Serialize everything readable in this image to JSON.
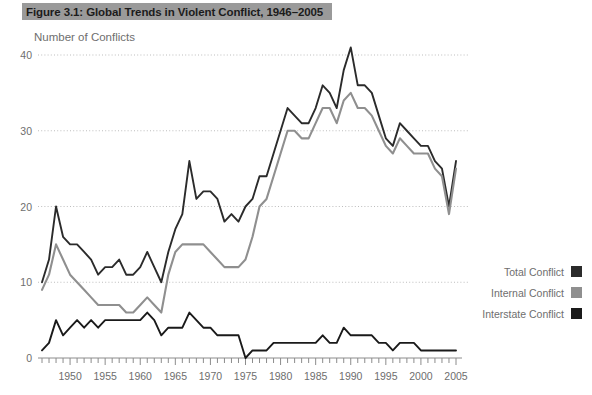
{
  "figure": {
    "title": "Figure 3.1: Global Trends in Violent Conflict, 1946–2005",
    "axis_label": "Number of Conflicts"
  },
  "legend": {
    "position": "right",
    "items": [
      {
        "label": "Total Conflict",
        "color": "#2b2b2b"
      },
      {
        "label": "Internal Conflict",
        "color": "#8f8f8f"
      },
      {
        "label": "Interstate Conflict",
        "color": "#1a1a1a"
      }
    ]
  },
  "chart_data": {
    "type": "line",
    "title": "Figure 3.1: Global Trends in Violent Conflict, 1946–2005",
    "xlabel": "",
    "ylabel": "Number of Conflicts",
    "xlim": [
      1946,
      2005
    ],
    "ylim": [
      0,
      42
    ],
    "yticks": [
      0,
      10,
      20,
      30,
      40
    ],
    "xticks": [
      1950,
      1955,
      1960,
      1965,
      1970,
      1975,
      1980,
      1985,
      1990,
      1995,
      2000,
      2005
    ],
    "xtick_minor_step": 1,
    "grid": "horizontal-dotted",
    "x": [
      1946,
      1947,
      1948,
      1949,
      1950,
      1951,
      1952,
      1953,
      1954,
      1955,
      1956,
      1957,
      1958,
      1959,
      1960,
      1961,
      1962,
      1963,
      1964,
      1965,
      1966,
      1967,
      1968,
      1969,
      1970,
      1971,
      1972,
      1973,
      1974,
      1975,
      1976,
      1977,
      1978,
      1979,
      1980,
      1981,
      1982,
      1983,
      1984,
      1985,
      1986,
      1987,
      1988,
      1989,
      1990,
      1991,
      1992,
      1993,
      1994,
      1995,
      1996,
      1997,
      1998,
      1999,
      2000,
      2001,
      2002,
      2003,
      2004,
      2005
    ],
    "series": [
      {
        "name": "Total Conflict",
        "color": "#2b2b2b",
        "values": [
          10,
          13,
          20,
          16,
          15,
          15,
          14,
          13,
          11,
          12,
          12,
          13,
          11,
          11,
          12,
          14,
          12,
          10,
          14,
          17,
          19,
          26,
          21,
          22,
          22,
          21,
          18,
          19,
          18,
          20,
          21,
          24,
          24,
          27,
          30,
          33,
          32,
          31,
          31,
          33,
          36,
          35,
          33,
          38,
          41,
          36,
          36,
          35,
          32,
          29,
          28,
          31,
          30,
          29,
          28,
          28,
          26,
          25,
          20,
          26
        ]
      },
      {
        "name": "Internal Conflict",
        "color": "#8f8f8f",
        "values": [
          9,
          11,
          15,
          13,
          11,
          10,
          9,
          8,
          7,
          7,
          7,
          7,
          6,
          6,
          7,
          8,
          7,
          6,
          11,
          14,
          15,
          15,
          15,
          15,
          14,
          13,
          12,
          12,
          12,
          13,
          16,
          20,
          21,
          24,
          27,
          30,
          30,
          29,
          29,
          31,
          33,
          33,
          31,
          34,
          35,
          33,
          33,
          32,
          30,
          28,
          27,
          29,
          28,
          27,
          27,
          27,
          25,
          24,
          19,
          25
        ]
      },
      {
        "name": "Interstate Conflict",
        "color": "#1a1a1a",
        "values": [
          1,
          2,
          5,
          3,
          4,
          5,
          4,
          5,
          4,
          5,
          5,
          5,
          5,
          5,
          5,
          6,
          5,
          3,
          4,
          4,
          4,
          6,
          5,
          4,
          4,
          3,
          3,
          3,
          3,
          0,
          1,
          1,
          1,
          2,
          2,
          2,
          2,
          2,
          2,
          2,
          3,
          2,
          2,
          4,
          3,
          3,
          3,
          3,
          2,
          2,
          1,
          2,
          2,
          2,
          1,
          1,
          1,
          1,
          1,
          1
        ]
      }
    ]
  }
}
